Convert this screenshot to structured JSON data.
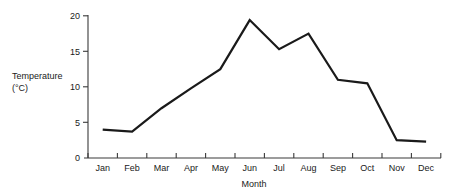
{
  "chart_data": {
    "type": "line",
    "title": "",
    "subtitle": "",
    "xlabel": "Month",
    "ylabel": "Temperature (°C)",
    "ylabel_line1": "Temperature",
    "ylabel_line2": "(°C)",
    "categories": [
      "Jan",
      "Feb",
      "Mar",
      "Apr",
      "May",
      "Jun",
      "Jul",
      "Aug",
      "Sep",
      "Oct",
      "Nov",
      "Dec"
    ],
    "values": [
      4.0,
      3.7,
      7.0,
      9.8,
      12.5,
      19.4,
      15.3,
      17.5,
      11.0,
      10.5,
      2.5,
      2.3
    ],
    "series": [
      {
        "name": "Temperature",
        "values": [
          4.0,
          3.7,
          7.0,
          9.8,
          12.5,
          19.4,
          15.3,
          17.5,
          11.0,
          10.5,
          2.5,
          2.3
        ]
      }
    ],
    "ylim": [
      0,
      20
    ],
    "y_ticks": [
      0,
      5,
      10,
      15,
      20
    ],
    "y_tick_labels": [
      "0",
      "5",
      "10",
      "15",
      "20"
    ],
    "x_tick_labels": [
      "Jan",
      "Feb",
      "Mar",
      "Apr",
      "May",
      "Jun",
      "Jul",
      "Aug",
      "Sep",
      "Oct",
      "Nov",
      "Dec"
    ],
    "grid": false,
    "legend": null,
    "legend_position": "none",
    "line_color": "#1a1a1a",
    "axis_color": "#3a3a3a",
    "background_color": "#ffffff",
    "annotations": []
  }
}
